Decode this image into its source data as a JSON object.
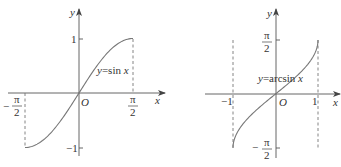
{
  "graphs": [
    {
      "function_label": "y=sin x",
      "function_prefix": "y",
      "function_body": "=sin ",
      "function_var": "x",
      "x_axis_label": "x",
      "y_axis_label": "y",
      "origin_label": "O",
      "x_ticks": [
        {
          "sign": "−",
          "num": "π",
          "den": "2",
          "value": -1.5708
        },
        {
          "sign": "",
          "num": "π",
          "den": "2",
          "value": 1.5708
        }
      ],
      "y_ticks": [
        {
          "label": "1",
          "value": 1
        },
        {
          "label": "−1",
          "value": -1
        }
      ],
      "domain": [
        -1.5708,
        1.5708
      ],
      "range": [
        -1,
        1
      ]
    },
    {
      "function_label": "y=arcsin x",
      "function_prefix": "y",
      "function_body": "=arcsin ",
      "function_var": "x",
      "x_axis_label": "x",
      "y_axis_label": "y",
      "origin_label": "O",
      "x_ticks": [
        {
          "label": "−1",
          "value": -1
        },
        {
          "label": "1",
          "value": 1
        }
      ],
      "y_ticks": [
        {
          "sign": "",
          "num": "π",
          "den": "2",
          "value": 1.5708
        },
        {
          "sign": "−",
          "num": "π",
          "den": "2",
          "value": -1.5708
        }
      ],
      "domain": [
        -1,
        1
      ],
      "range": [
        -1.5708,
        1.5708
      ]
    }
  ]
}
